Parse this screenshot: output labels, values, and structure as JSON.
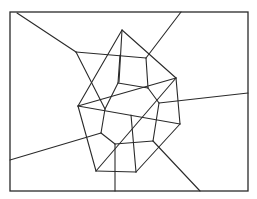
{
  "diagram": {
    "type": "voronoi-delaunay",
    "stroke_color": "#2a2a2a",
    "background": "#ffffff",
    "frame": {
      "x1": 10,
      "y1": 12,
      "x2": 248,
      "y2": 191
    },
    "sites": [
      {
        "id": "P1",
        "x": 122,
        "y": 30
      },
      {
        "id": "P2",
        "x": 176,
        "y": 78
      },
      {
        "id": "P3",
        "x": 78,
        "y": 106
      },
      {
        "id": "P4",
        "x": 180,
        "y": 124
      },
      {
        "id": "P5",
        "x": 131,
        "y": 115
      },
      {
        "id": "P6",
        "x": 96,
        "y": 171
      },
      {
        "id": "P7",
        "x": 136,
        "y": 172
      }
    ],
    "delaunay_edges": [
      [
        122,
        30,
        78,
        106
      ],
      [
        122,
        30,
        176,
        78
      ],
      [
        122,
        30,
        119,
        82
      ],
      [
        78,
        106,
        176,
        78
      ],
      [
        78,
        106,
        180,
        124
      ],
      [
        78,
        106,
        96,
        171
      ],
      [
        96,
        171,
        136,
        172
      ],
      [
        136,
        172,
        180,
        124
      ],
      [
        180,
        124,
        176,
        78
      ],
      [
        96,
        171,
        176,
        78
      ],
      [
        131,
        115,
        136,
        172
      ]
    ],
    "voronoi_edges": [
      [
        17,
        13,
        76,
        52
      ],
      [
        76,
        52,
        146,
        58
      ],
      [
        146,
        58,
        181,
        12
      ],
      [
        76,
        52,
        105,
        109
      ],
      [
        120,
        55,
        118,
        83
      ],
      [
        146,
        58,
        148,
        88
      ],
      [
        118,
        83,
        148,
        88
      ],
      [
        118,
        83,
        105,
        109
      ],
      [
        148,
        88,
        159,
        103
      ],
      [
        159,
        103,
        248,
        93
      ],
      [
        105,
        109,
        101,
        133
      ],
      [
        101,
        133,
        10,
        160
      ],
      [
        101,
        133,
        115,
        144
      ],
      [
        159,
        103,
        153,
        141
      ],
      [
        115,
        144,
        153,
        141
      ],
      [
        115,
        144,
        115,
        191
      ],
      [
        153,
        141,
        200,
        191
      ]
    ]
  }
}
